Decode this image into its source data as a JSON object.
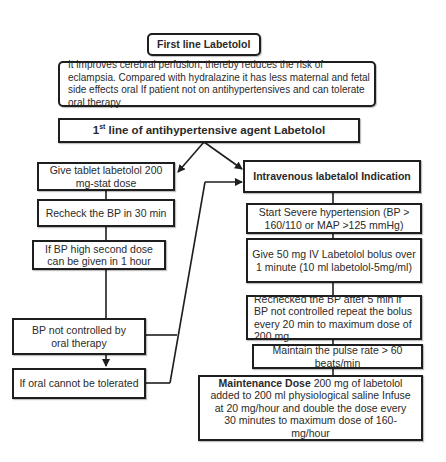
{
  "title": "First line Labetolol",
  "description": "It improves cerebral perfusion, thereby reduces the risk of eclampsia. Compared with hydralazine it has less maternal and fetal side effects oral If patient not on antihypertensives and can tolerate oral therapy",
  "header": {
    "ordinal": "1",
    "ordinal_suffix": "st",
    "text": " line of antihypertensive agent Labetolol"
  },
  "oral_branch": {
    "steps": [
      "Give tablet labetolol 200 mg-stat dose",
      "Recheck the BP in 30 min",
      "If BP high second dose can be given in 1 hour",
      "BP not controlled by oral therapy",
      "If oral cannot be tolerated"
    ]
  },
  "iv_branch": {
    "title": "Intravenous labetalol Indication",
    "steps": [
      "Start Severe hypertension (BP > 160/110 or MAP >125 mmHg)",
      "Give 50 mg IV Labetolol bolus  over 1 minute (10 ml labetolol-5mg/ml)",
      "Rechecked the BP after 5 min if BP not controlled repeat the bolus every 20 min to maximum dose of 200 mg",
      "Maintain the pulse rate > 60 beats/min"
    ],
    "maintenance": {
      "label": "Maintenance Dose",
      "text": " 200 mg of labetolol added to 200 ml physiological saline Infuse at 20 mg/hour and double the dose every 30 minutes to maximum dose of 160-mg/hour"
    }
  },
  "colors": {
    "border": "#1e1e1e",
    "text": "#2a2a2a",
    "background": "#ffffff"
  }
}
